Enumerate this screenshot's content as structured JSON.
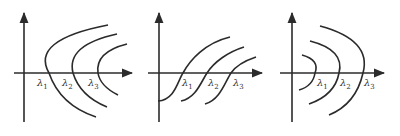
{
  "figure": {
    "stroke_color": "#2b2b2b",
    "panels": [
      {
        "id": "panel-1",
        "shape": "parabolas opening right",
        "labels": [
          {
            "base": "λ",
            "sub": "1"
          },
          {
            "base": "λ",
            "sub": "2"
          },
          {
            "base": "λ",
            "sub": "3"
          }
        ]
      },
      {
        "id": "panel-2",
        "shape": "increasing S-shaped curves",
        "labels": [
          {
            "base": "λ",
            "sub": "1"
          },
          {
            "base": "λ",
            "sub": "2"
          },
          {
            "base": "λ",
            "sub": "3"
          }
        ]
      },
      {
        "id": "panel-3",
        "shape": "arcs opening left",
        "labels": [
          {
            "base": "λ",
            "sub": "1"
          },
          {
            "base": "λ",
            "sub": "2"
          },
          {
            "base": "λ",
            "sub": "3"
          }
        ]
      }
    ]
  }
}
